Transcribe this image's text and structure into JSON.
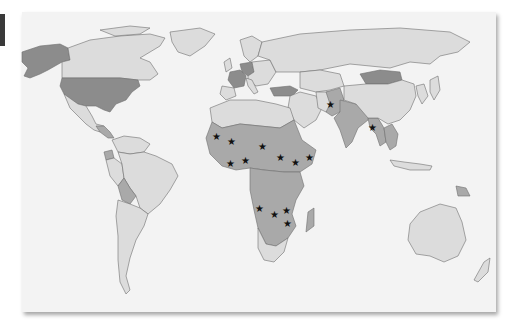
{
  "figure": {
    "type": "world choropleth map",
    "legend_tab_color": "#3a3a3a",
    "colors": {
      "ocean": "#f3f3f3",
      "light_country": "#dcdcdc",
      "medium_country": "#a9a9a9",
      "dark_country": "#8c8c8c",
      "border": "#6e6e6e",
      "star": "#111111"
    },
    "shading_levels": [
      {
        "level": "dark",
        "regions": [
          "United States",
          "Alaska",
          "France",
          "Germany",
          "Turkey",
          "Mongolia"
        ]
      },
      {
        "level": "medium",
        "regions": [
          "Sub-Saharan Africa",
          "India",
          "Pakistan",
          "Afghanistan",
          "Bangladesh",
          "Myanmar",
          "Bolivia",
          "Ecuador",
          "Papua New Guinea",
          "Cambodia",
          "Laos"
        ]
      },
      {
        "level": "light",
        "regions": [
          "Canada",
          "Greenland",
          "Mexico",
          "Brazil",
          "Argentina",
          "Russia",
          "China",
          "Australia",
          "Europe (other)",
          "North Africa"
        ]
      }
    ],
    "star_markers": [
      {
        "id": "mali",
        "x": 217,
        "y": 136
      },
      {
        "id": "niger",
        "x": 232,
        "y": 141
      },
      {
        "id": "burkina-ghana",
        "x": 231,
        "y": 163
      },
      {
        "id": "nigeria",
        "x": 246,
        "y": 160
      },
      {
        "id": "chad",
        "x": 263,
        "y": 146
      },
      {
        "id": "sudan",
        "x": 281,
        "y": 157
      },
      {
        "id": "ethiopia",
        "x": 296,
        "y": 162
      },
      {
        "id": "somalia",
        "x": 310,
        "y": 157
      },
      {
        "id": "angola",
        "x": 260,
        "y": 208
      },
      {
        "id": "zambia",
        "x": 275,
        "y": 214
      },
      {
        "id": "malawi",
        "x": 287,
        "y": 210
      },
      {
        "id": "mozambique",
        "x": 288,
        "y": 223
      },
      {
        "id": "afghanistan-pakistan",
        "x": 331,
        "y": 104
      },
      {
        "id": "bangladesh",
        "x": 373,
        "y": 127
      }
    ],
    "star_glyph": "★"
  }
}
